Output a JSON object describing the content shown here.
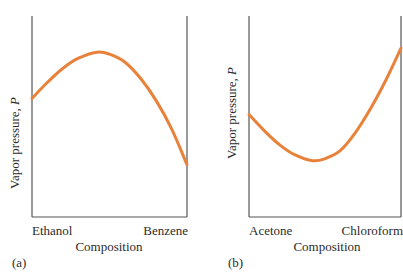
{
  "chart_data": [
    {
      "panel": "(a)",
      "type": "line",
      "title": "",
      "xlabel": "Composition",
      "ylabel": "Vapor pressure, P",
      "x_tick_labels": [
        "Ethanol",
        "Benzene"
      ],
      "x": [
        0,
        0.1,
        0.2,
        0.3,
        0.42,
        0.5,
        0.6,
        0.7,
        0.8,
        0.9,
        1.0
      ],
      "values": [
        0.59,
        0.67,
        0.74,
        0.79,
        0.82,
        0.81,
        0.77,
        0.69,
        0.58,
        0.44,
        0.26
      ],
      "ylim": [
        0,
        1
      ],
      "xlim": [
        0,
        1
      ],
      "grid": false,
      "color": "#E8823A",
      "annotation": "positive deviation (maximum vapor pressure)"
    },
    {
      "panel": "(b)",
      "type": "line",
      "title": "",
      "xlabel": "Composition",
      "ylabel": "Vapor pressure, P",
      "x_tick_labels": [
        "Acetone",
        "Chloroform"
      ],
      "x": [
        0,
        0.1,
        0.2,
        0.3,
        0.42,
        0.5,
        0.6,
        0.7,
        0.8,
        0.9,
        1.0
      ],
      "values": [
        0.51,
        0.43,
        0.36,
        0.31,
        0.28,
        0.29,
        0.33,
        0.42,
        0.54,
        0.68,
        0.84
      ],
      "ylim": [
        0,
        1
      ],
      "xlim": [
        0,
        1
      ],
      "grid": false,
      "color": "#E8823A",
      "annotation": "negative deviation (minimum vapor pressure)"
    }
  ],
  "panels": {
    "a": {
      "label": "(a)",
      "ylabel": "Vapor pressure, ",
      "ylabel_var": "P",
      "xlabel": "Composition",
      "left_component": "Ethanol",
      "right_component": "Benzene"
    },
    "b": {
      "label": "(b)",
      "ylabel": "Vapor pressure, ",
      "ylabel_var": "P",
      "xlabel": "Composition",
      "left_component": "Acetone",
      "right_component": "Chloroform"
    }
  }
}
